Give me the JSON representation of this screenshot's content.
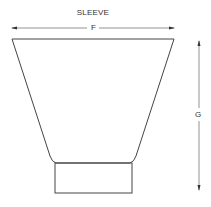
{
  "diagram": {
    "title": "SLEEVE",
    "dimensions": [
      {
        "id": "F",
        "label": "F",
        "orientation": "horizontal",
        "description": "top width"
      },
      {
        "id": "G",
        "label": "G",
        "orientation": "vertical",
        "description": "overall height"
      }
    ],
    "colors": {
      "line": "#444444",
      "dimension_line": "#777777",
      "background": "#ffffff"
    }
  }
}
